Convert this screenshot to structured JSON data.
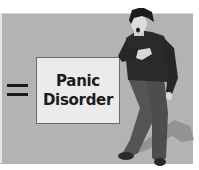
{
  "illustration": {
    "symbol": "=",
    "label_lines": [
      "Panic",
      "Disorder"
    ],
    "figure_description": "person-clutching-chest",
    "colors": {
      "panel": "#b3b3b3",
      "box_fill": "#ebebeb",
      "box_border": "#6b6b6b",
      "text": "#1c1c1c",
      "shirt": "#2a2a2a",
      "pants": "#555555",
      "shadow": "#8f8f8f"
    }
  }
}
